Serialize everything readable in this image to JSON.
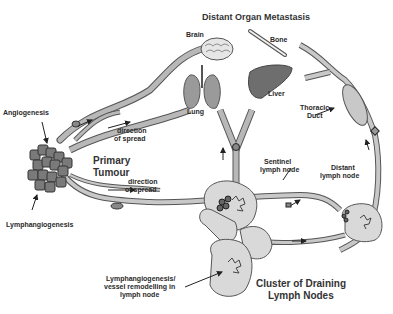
{
  "diagram": {
    "title": "Distant Organ Metastasis",
    "organs": {
      "brain": "Brain",
      "bone": "Bone",
      "lung": "Lung",
      "liver": "Liver"
    },
    "labels": {
      "angiogenesis": "Angiogenesis",
      "lymphangiogenesis": "Lymphangiogenesis",
      "primary_tumour_1": "Primary",
      "primary_tumour_2": "Tumour",
      "direction_upper_1": "direction",
      "direction_upper_2": "of spread",
      "direction_lower_1": "direction",
      "direction_lower_2": "of spread",
      "thoracic_duct_1": "Thoracic",
      "thoracic_duct_2": "Duct",
      "sentinel_1": "Sentinel",
      "sentinel_2": "lymph node",
      "distant_1": "Distant",
      "distant_2": "lymph node",
      "remodel_1": "Lymphangiogenesis/",
      "remodel_2": "vessel remodelling in",
      "remodel_3": "lymph node",
      "cluster_1": "Cluster of Draining",
      "cluster_2": "Lymph Nodes"
    },
    "colors": {
      "vessel_fill": "#b8b8b8",
      "vessel_stroke": "#555555",
      "node_fill": "#d9d9d9",
      "tumour_fill": "#7a7a7a",
      "text": "#2a2a2a"
    }
  }
}
